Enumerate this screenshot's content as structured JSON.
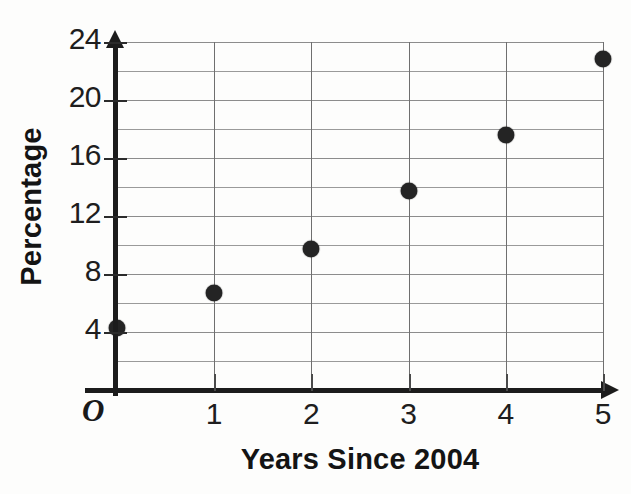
{
  "figure": {
    "origin_label": "O",
    "background_color": "#fdfdfc",
    "point_color": "#242424",
    "axis_color": "#1c1c1c",
    "grid_color": "#8c8c8c"
  },
  "chart_data": {
    "type": "scatter",
    "title": "",
    "xlabel": "Years Since 2004",
    "ylabel": "Percentage",
    "x": [
      0,
      1,
      2,
      3,
      4,
      5
    ],
    "values": [
      4.3,
      6.7,
      9.7,
      13.7,
      17.6,
      22.8
    ],
    "points": [
      {
        "x": 0,
        "y": 4.3
      },
      {
        "x": 1,
        "y": 6.7
      },
      {
        "x": 2,
        "y": 9.7
      },
      {
        "x": 3,
        "y": 13.7
      },
      {
        "x": 4,
        "y": 17.6
      },
      {
        "x": 5,
        "y": 22.8
      }
    ],
    "xlim": [
      0,
      5
    ],
    "ylim": [
      0,
      24
    ],
    "xticks": [
      1,
      2,
      3,
      4,
      5
    ],
    "xtick_labels": [
      "1",
      "2",
      "3",
      "4",
      "5"
    ],
    "yticks": [
      4,
      8,
      12,
      16,
      20,
      24
    ],
    "ytick_labels": [
      "4",
      "8",
      "12",
      "16",
      "20",
      "24"
    ],
    "y_gridlines": [
      2,
      4,
      6,
      8,
      10,
      12,
      14,
      16,
      18,
      20,
      22,
      24
    ],
    "x_gridlines": [
      0,
      1,
      2,
      3,
      4,
      5
    ],
    "grid": true,
    "legend": null,
    "legend_position": "none",
    "annotations": []
  }
}
